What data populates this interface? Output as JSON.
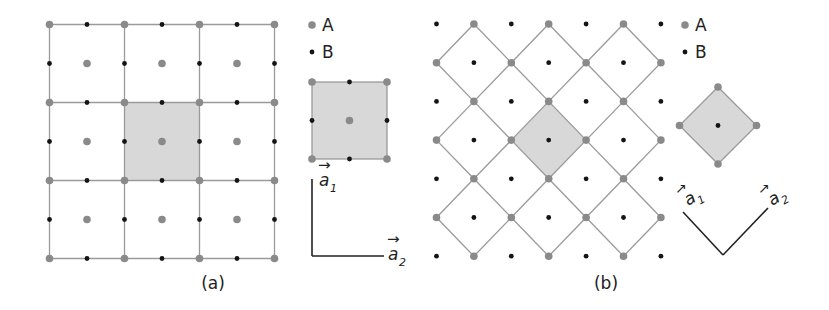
{
  "figure": {
    "panels": [
      {
        "id": "a",
        "caption": "(a)",
        "lattice": "square",
        "cells_x": 3,
        "cells_y": 3,
        "highlighted_cell": [
          1,
          1
        ],
        "unit_cell_vectors": [
          "a1",
          "a2"
        ]
      },
      {
        "id": "b",
        "caption": "(b)",
        "lattice": "rotated-square",
        "rows": 7,
        "cols": 7,
        "highlighted_cell_center": [
          3,
          3
        ],
        "unit_cell_vectors": [
          "a1",
          "a2"
        ]
      }
    ],
    "legend": [
      {
        "label": "A",
        "marker": "gray-dot"
      },
      {
        "label": "B",
        "marker": "black-dot"
      }
    ],
    "vector_labels": {
      "a1": "a",
      "a1_sub": "1",
      "a2": "a",
      "a2_sub": "2",
      "arrow": "→"
    },
    "colors": {
      "site_a": "#8a8a8a",
      "site_b": "#141414",
      "grid_line": "#9a9a9a",
      "cell_fill": "#d8d8d8",
      "axis_line": "#222222"
    }
  }
}
